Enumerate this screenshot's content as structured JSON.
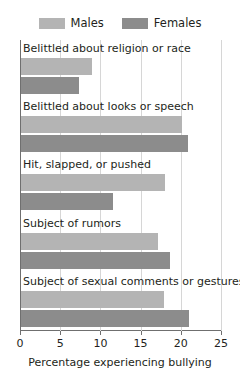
{
  "chart_data": {
    "type": "bar",
    "orientation": "horizontal",
    "title": "",
    "xlabel": "Percentage experiencing bullying",
    "ylabel": "",
    "xlim": [
      0,
      25
    ],
    "xticks": [
      0,
      5,
      10,
      15,
      20,
      25
    ],
    "xtick_labels": [
      "0",
      "5",
      "10",
      "15",
      "20",
      "25"
    ],
    "grid": true,
    "grid_axis": "x",
    "legend_position": "top",
    "categories": [
      "Belittled about religion or race",
      "Belittled about looks or speech",
      "Hit, slapped, or pushed",
      "Subject of rumors",
      "Subject of sexual comments or gestures"
    ],
    "series": [
      {
        "name": "Males",
        "color": "#b4b4b4",
        "values": [
          8.8,
          20.0,
          17.9,
          17.0,
          17.8
        ]
      },
      {
        "name": "Females",
        "color": "#8c8c8c",
        "values": [
          7.2,
          20.8,
          11.4,
          18.5,
          20.9
        ]
      }
    ]
  },
  "legend": {
    "entries": [
      {
        "label": "Males",
        "color": "#b4b4b4"
      },
      {
        "label": "Females",
        "color": "#8c8c8c"
      }
    ]
  },
  "axis": {
    "x_title": "Percentage experiencing bullying"
  },
  "colors": {
    "males": "#b4b4b4",
    "females": "#8c8c8c",
    "axis": "#6f6f6f",
    "grid": "#d6d6d6",
    "text": "#231f20",
    "background": "#ffffff"
  }
}
